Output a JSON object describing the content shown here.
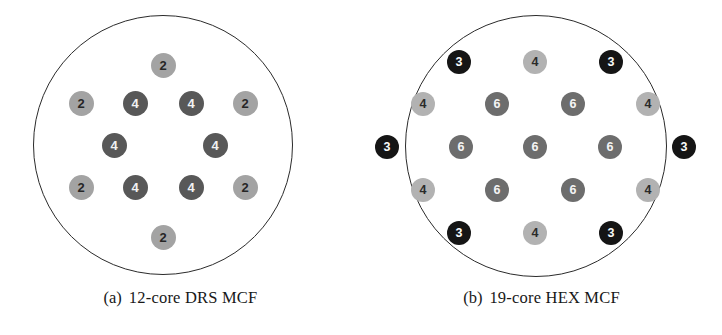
{
  "figure": {
    "subfigures": [
      {
        "tag": "(a)",
        "caption": "12-core DRS MCF",
        "cladding_shape": "circle",
        "core_count": 12,
        "layout": "dual-ring square (DRS)",
        "core_colors": {
          "2": "#a3a3a3",
          "4": "#585858"
        },
        "cores": [
          {
            "label": "2",
            "type": "2",
            "x": 163,
            "y": 65
          },
          {
            "label": "2",
            "type": "2",
            "x": 81,
            "y": 103
          },
          {
            "label": "4",
            "type": "4",
            "x": 135,
            "y": 103
          },
          {
            "label": "4",
            "type": "4",
            "x": 191,
            "y": 103
          },
          {
            "label": "2",
            "type": "2",
            "x": 245,
            "y": 103
          },
          {
            "label": "4",
            "type": "4",
            "x": 114,
            "y": 145
          },
          {
            "label": "4",
            "type": "4",
            "x": 215,
            "y": 145
          },
          {
            "label": "2",
            "type": "2",
            "x": 81,
            "y": 187
          },
          {
            "label": "4",
            "type": "4",
            "x": 135,
            "y": 187
          },
          {
            "label": "4",
            "type": "4",
            "x": 191,
            "y": 187
          },
          {
            "label": "2",
            "type": "2",
            "x": 245,
            "y": 187
          },
          {
            "label": "2",
            "type": "2",
            "x": 163,
            "y": 237
          }
        ]
      },
      {
        "tag": "(b)",
        "caption": "19-core HEX MCF",
        "cladding_shape": "circle",
        "core_count": 19,
        "layout": "hexagonal (HEX)",
        "core_colors": {
          "3": "#151515",
          "4": "#b2b2b2",
          "6": "#6d6d6d"
        },
        "cores": [
          {
            "label": "3",
            "type": "3",
            "x": 98,
            "y": 62
          },
          {
            "label": "4",
            "type": "4b",
            "x": 174,
            "y": 62
          },
          {
            "label": "3",
            "type": "3",
            "x": 250,
            "y": 62
          },
          {
            "label": "4",
            "type": "4b",
            "x": 62,
            "y": 104
          },
          {
            "label": "6",
            "type": "6",
            "x": 136,
            "y": 104
          },
          {
            "label": "6",
            "type": "6",
            "x": 212,
            "y": 104
          },
          {
            "label": "4",
            "type": "4b",
            "x": 287,
            "y": 104
          },
          {
            "label": "3",
            "type": "3",
            "x": 26,
            "y": 147
          },
          {
            "label": "6",
            "type": "6",
            "x": 100,
            "y": 147
          },
          {
            "label": "6",
            "type": "6",
            "x": 174,
            "y": 147
          },
          {
            "label": "6",
            "type": "6",
            "x": 249,
            "y": 147
          },
          {
            "label": "3",
            "type": "3",
            "x": 323,
            "y": 147
          },
          {
            "label": "4",
            "type": "4b",
            "x": 62,
            "y": 190
          },
          {
            "label": "6",
            "type": "6",
            "x": 136,
            "y": 190
          },
          {
            "label": "6",
            "type": "6",
            "x": 212,
            "y": 190
          },
          {
            "label": "4",
            "type": "4b",
            "x": 287,
            "y": 190
          },
          {
            "label": "3",
            "type": "3",
            "x": 98,
            "y": 233
          },
          {
            "label": "4",
            "type": "4b",
            "x": 174,
            "y": 233
          },
          {
            "label": "3",
            "type": "3",
            "x": 250,
            "y": 233
          }
        ]
      }
    ]
  }
}
